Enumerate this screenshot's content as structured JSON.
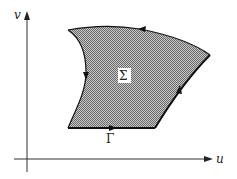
{
  "diagram": {
    "axes": {
      "x_label": "u",
      "y_label": "v"
    },
    "region": {
      "label": "Σ",
      "fill_color": "#9a9a9a",
      "pattern": "checker-halftone"
    },
    "boundary": {
      "label": "Γ",
      "orientation": "counterclockwise",
      "stroke_color": "#111111"
    }
  }
}
